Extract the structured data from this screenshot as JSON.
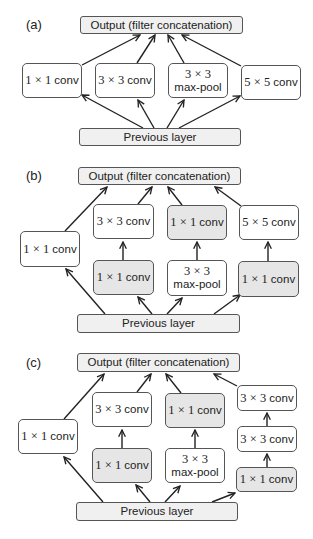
{
  "panels": {
    "a": {
      "label": "(a)",
      "output": "Output (filter concatenation)",
      "previous": "Previous layer",
      "boxes": {
        "conv1x1": {
          "dim": "1 × 1",
          "op": "conv"
        },
        "conv3x3": {
          "dim": "3 × 3",
          "op": "conv"
        },
        "maxpool": {
          "dim": "3 × 3",
          "op": "max-pool"
        },
        "conv5x5": {
          "dim": "5 × 5",
          "op": "conv"
        }
      }
    },
    "b": {
      "label": "(b)",
      "output": "Output (filter concatenation)",
      "previous": "Previous layer",
      "boxes": {
        "conv1x1_left": {
          "dim": "1 × 1",
          "op": "conv"
        },
        "conv3x3": {
          "dim": "3 × 3",
          "op": "conv"
        },
        "reduce_3x3": {
          "dim": "1 × 1",
          "op": "conv"
        },
        "proj_pool": {
          "dim": "1 × 1",
          "op": "conv"
        },
        "maxpool": {
          "dim": "3 × 3",
          "op": "max-pool"
        },
        "conv5x5": {
          "dim": "5 × 5",
          "op": "conv"
        },
        "reduce_5x5": {
          "dim": "1 × 1",
          "op": "conv"
        }
      }
    },
    "c": {
      "label": "(c)",
      "output": "Output (filter concatenation)",
      "previous": "Previous layer",
      "boxes": {
        "conv1x1_left": {
          "dim": "1 × 1",
          "op": "conv"
        },
        "conv3x3": {
          "dim": "3 × 3",
          "op": "conv"
        },
        "reduce_3x3": {
          "dim": "1 × 1",
          "op": "conv"
        },
        "proj_pool": {
          "dim": "1 × 1",
          "op": "conv"
        },
        "maxpool": {
          "dim": "3 × 3",
          "op": "max-pool"
        },
        "conv3x3_top": {
          "dim": "3 × 3",
          "op": "conv"
        },
        "conv3x3_mid": {
          "dim": "3 × 3",
          "op": "conv"
        },
        "reduce_right": {
          "dim": "1 × 1",
          "op": "conv"
        }
      }
    }
  },
  "colors": {
    "border": "#555555",
    "reduction_fill": "#e6e6e6",
    "bar_fill": "#f0f0f0",
    "arrow": "#222222"
  }
}
